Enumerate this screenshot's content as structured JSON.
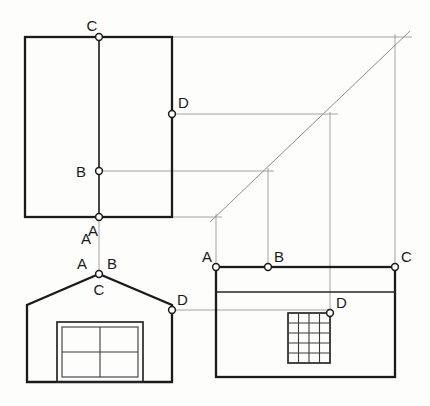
{
  "drawing": {
    "title": "Orthographic projection construction: plan, front elevation and side elevation of a gabled building",
    "type": "technical-line-drawing",
    "background_color": "#fdfdfc",
    "line_color": "#1b1b1b",
    "projection_line_color": "#9a9a9a",
    "node_fill_color": "#ffffff"
  },
  "views": {
    "plan": {
      "name": "Plan view (top left)",
      "rect": {
        "x": 25,
        "y": 37,
        "width": 147,
        "height": 180
      },
      "ridge_line": {
        "x": 99,
        "y1": 37,
        "y2": 217
      },
      "points": [
        {
          "id": "C",
          "label": "C",
          "x": 99,
          "y": 37,
          "label_x": 92,
          "label_y": 31
        },
        {
          "id": "D",
          "label": "D",
          "x": 172,
          "y": 114,
          "label_x": 176,
          "label_y": 108
        },
        {
          "id": "B",
          "label": "B",
          "x": 99,
          "y": 171,
          "label_x": 81,
          "label_y": 176
        },
        {
          "id": "A",
          "label": "A",
          "x": 99,
          "y": 217,
          "label_x": 90,
          "label_y": 236
        }
      ]
    },
    "front_elevation": {
      "name": "Front elevation (bottom left)",
      "base_y": 382,
      "left_x": 27,
      "right_x": 172,
      "eaves_y": 305,
      "apex": {
        "x": 99,
        "y": 274
      },
      "door": {
        "outer": {
          "x": 57,
          "y": 322,
          "width": 86,
          "height": 60
        },
        "inner": {
          "x": 61,
          "y": 326,
          "width": 78,
          "height": 52
        },
        "panes_cols": 2,
        "panes_rows": 2
      },
      "points": [
        {
          "id": "C",
          "label": "C",
          "x": 99,
          "y": 274,
          "label_x": 92,
          "label_y": 294
        },
        {
          "id": "D",
          "label": "D",
          "x": 172,
          "y": 310,
          "label_x": 176,
          "label_y": 305
        }
      ],
      "aux_labels": [
        {
          "label": "A",
          "x": 84,
          "y": 238
        },
        {
          "label": "A",
          "x": 79,
          "y": 265
        },
        {
          "label": "B",
          "x": 105,
          "y": 265
        }
      ]
    },
    "side_elevation": {
      "name": "Side elevation (bottom right)",
      "rect": {
        "x": 216,
        "y": 267,
        "width": 179,
        "height": 110
      },
      "eaves_line_y": 292,
      "window": {
        "x": 288,
        "y": 313,
        "width": 42,
        "height": 50,
        "cols": 4,
        "rows": 5
      },
      "points": [
        {
          "id": "A",
          "label": "A",
          "x": 216,
          "y": 267,
          "label_x": 205,
          "label_y": 262
        },
        {
          "id": "B",
          "label": "B",
          "x": 268,
          "y": 267,
          "label_x": 272,
          "label_y": 262
        },
        {
          "id": "C",
          "label": "C",
          "x": 395,
          "y": 267,
          "label_x": 399,
          "label_y": 262
        },
        {
          "id": "D",
          "label": "D",
          "x": 330,
          "y": 313,
          "label_x": 334,
          "label_y": 308
        }
      ]
    }
  },
  "construction": {
    "miter_line": {
      "x1": 210,
      "y1": 222,
      "x2": 408,
      "y2": 33,
      "angle_degrees": 45
    },
    "horizontal_projection_lines": [
      {
        "from_view": "plan",
        "point": "C",
        "y": 37,
        "x1": 172,
        "x2": 412
      },
      {
        "from_view": "plan",
        "point": "D",
        "y": 114,
        "x1": 172,
        "x2": 336
      },
      {
        "from_view": "plan",
        "point": "B",
        "y": 171,
        "x1": 99,
        "x2": 272
      },
      {
        "from_view": "plan",
        "point": "A",
        "y": 217,
        "x1": 99,
        "x2": 220
      },
      {
        "from_view": "front",
        "point": "D",
        "y": 310,
        "x1": 172,
        "x2": 330
      }
    ],
    "vertical_projection_lines": [
      {
        "label": "A",
        "x": 216,
        "y1": 222,
        "y2": 267
      },
      {
        "label": "B",
        "x": 268,
        "y1": 171,
        "y2": 267
      },
      {
        "label": "ridge",
        "x": 330,
        "y1": 114,
        "y2": 313
      },
      {
        "label": "C",
        "x": 395,
        "y1": 37,
        "y2": 267
      },
      {
        "label": "plan-A",
        "x": 99,
        "y1": 217,
        "y2": 274
      }
    ]
  },
  "labels": {
    "point_ids": [
      "A",
      "B",
      "C",
      "D"
    ]
  }
}
